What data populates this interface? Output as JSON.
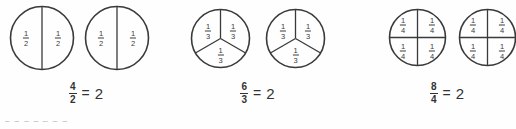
{
  "diagram": {
    "background_color": "#fefefe",
    "stroke_color": "#3a3a3a",
    "text_color": "#333333",
    "groups": [
      {
        "id": "halves",
        "denominator": 2,
        "slices_per_circle": 2,
        "circle_count": 2,
        "slice_label_num": "1",
        "slice_label_den": "2",
        "slice_labels": [
          "1/2",
          "1/2",
          "1/2",
          "1/2"
        ],
        "equation": {
          "numerator": "4",
          "denominator": "2",
          "equals": "=",
          "result": "2",
          "text": "4/2 = 2"
        }
      },
      {
        "id": "thirds",
        "denominator": 3,
        "slices_per_circle": 3,
        "circle_count": 2,
        "slice_label_num": "1",
        "slice_label_den": "3",
        "slice_labels": [
          "1/3",
          "1/3",
          "1/3",
          "1/3",
          "1/3",
          "1/3"
        ],
        "equation": {
          "numerator": "6",
          "denominator": "3",
          "equals": "=",
          "result": "2",
          "text": "6/3 = 2"
        }
      },
      {
        "id": "quarters",
        "denominator": 4,
        "slices_per_circle": 4,
        "circle_count": 2,
        "slice_label_num": "1",
        "slice_label_den": "4",
        "slice_labels": [
          "1/4",
          "1/4",
          "1/4",
          "1/4",
          "1/4",
          "1/4",
          "1/4",
          "1/4"
        ],
        "equation": {
          "numerator": "8",
          "denominator": "4",
          "equals": "=",
          "result": "2",
          "text": "8/4 = 2"
        }
      }
    ],
    "clipped_next_line": "1 1 1       1     2   1  1"
  }
}
